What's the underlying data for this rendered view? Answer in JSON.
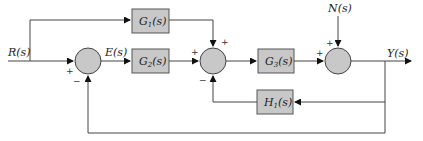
{
  "diagram": {
    "type": "control-system-block-diagram",
    "signals": {
      "input": "R(s)",
      "error": "E(s)",
      "disturbance": "N(s)",
      "output": "Y(s)"
    },
    "blocks": {
      "g1": "G",
      "g1_sub": "1",
      "g1_arg": "(s)",
      "g2": "G",
      "g2_sub": "2",
      "g2_arg": "(s)",
      "g3": "G",
      "g3_sub": "3",
      "g3_arg": "(s)",
      "h1": "H",
      "h1_sub": "1",
      "h1_arg": "(s)"
    },
    "signs": {
      "sum1_input": "+",
      "sum1_feedback": "−",
      "sum2_g2": "+",
      "sum2_g1": "+",
      "sum2_h1": "−",
      "sum3_g3": "+",
      "sum3_n": "+"
    },
    "colors": {
      "block_fill": "#c8c8c8",
      "line": "#444444"
    }
  }
}
